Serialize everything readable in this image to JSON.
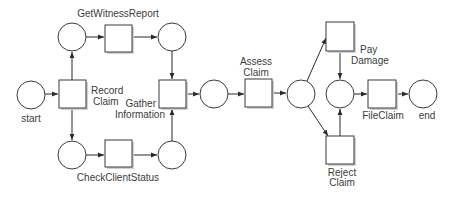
{
  "diagram": {
    "type": "petri-net",
    "colors": {
      "stroke": "#3a3a3a",
      "fill": "#ffffff",
      "text": "#3c3c3c"
    },
    "places": [
      {
        "id": "start",
        "label": "start"
      },
      {
        "id": "p_witness_in",
        "label": ""
      },
      {
        "id": "p_witness_out",
        "label": ""
      },
      {
        "id": "p_client_in",
        "label": ""
      },
      {
        "id": "p_client_out",
        "label": ""
      },
      {
        "id": "p_gathered",
        "label": ""
      },
      {
        "id": "p_assessed",
        "label": ""
      },
      {
        "id": "p_decided",
        "label": ""
      },
      {
        "id": "end",
        "label": "end"
      }
    ],
    "transitions": [
      {
        "id": "record_claim",
        "label_line1": "Record",
        "label_line2": "Claim"
      },
      {
        "id": "get_witness_report",
        "label": "GetWitnessReport"
      },
      {
        "id": "check_client_status",
        "label": "CheckClientStatus"
      },
      {
        "id": "gather_information",
        "label_line1": "Gather",
        "label_line2": "Information"
      },
      {
        "id": "assess_claim",
        "label_line1": "Assess",
        "label_line2": "Claim"
      },
      {
        "id": "pay_damage",
        "label_line1": "Pay",
        "label_line2": "Damage"
      },
      {
        "id": "reject_claim",
        "label_line1": "Reject",
        "label_line2": "Claim"
      },
      {
        "id": "file_claim",
        "label": "FileClaim"
      }
    ],
    "arcs": [
      [
        "start",
        "record_claim"
      ],
      [
        "record_claim",
        "p_witness_in"
      ],
      [
        "record_claim",
        "p_client_in"
      ],
      [
        "p_witness_in",
        "get_witness_report"
      ],
      [
        "get_witness_report",
        "p_witness_out"
      ],
      [
        "p_client_in",
        "check_client_status"
      ],
      [
        "check_client_status",
        "p_client_out"
      ],
      [
        "p_witness_out",
        "gather_information"
      ],
      [
        "p_client_out",
        "gather_information"
      ],
      [
        "gather_information",
        "p_gathered"
      ],
      [
        "p_gathered",
        "assess_claim"
      ],
      [
        "assess_claim",
        "p_assessed"
      ],
      [
        "p_assessed",
        "pay_damage"
      ],
      [
        "p_assessed",
        "reject_claim"
      ],
      [
        "pay_damage",
        "p_decided"
      ],
      [
        "reject_claim",
        "p_decided"
      ],
      [
        "p_decided",
        "file_claim"
      ],
      [
        "file_claim",
        "end"
      ]
    ]
  }
}
